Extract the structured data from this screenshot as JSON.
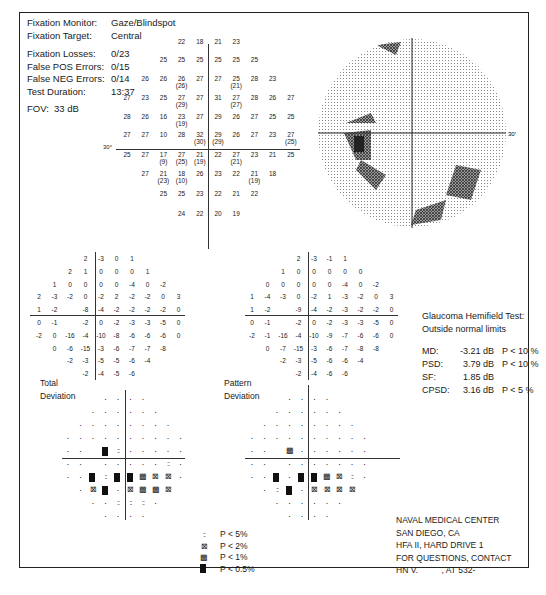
{
  "header": {
    "fixation_monitor": {
      "label": "Fixation Monitor:",
      "value": "Gaze/Blindspot"
    },
    "fixation_target": {
      "label": "Fixation Target:",
      "value": "Central"
    },
    "fixation_losses": {
      "label": "Fixation Losses:",
      "value": "0/23"
    },
    "false_pos": {
      "label": "False POS Errors:",
      "value": "0/15"
    },
    "false_neg": {
      "label": "False NEG Errors:",
      "value": "0/14"
    },
    "test_duration": {
      "label": "Test Duration:",
      "value": "13:37"
    },
    "fov": {
      "label": "FOV:",
      "value": "33 dB"
    }
  },
  "threshold_plot": {
    "axis_label_left": "30°",
    "axis_label_right": "30°",
    "rows": [
      [
        "",
        "",
        "",
        "22",
        "18",
        "21",
        "23",
        "",
        "",
        ""
      ],
      [
        "",
        "",
        "25",
        "25",
        "25",
        "25",
        "25",
        "25",
        "",
        ""
      ],
      [
        "",
        "26",
        "26",
        "26 (26)",
        "27",
        "27",
        "25 (21)",
        "28",
        "23",
        ""
      ],
      [
        "27",
        "23",
        "25",
        "27 (29)",
        "27",
        "31",
        "27 (27)",
        "28",
        "26",
        "27"
      ],
      [
        "28",
        "26",
        "16",
        "23 (19)",
        "27",
        "29",
        "26",
        "27",
        "25",
        "25"
      ],
      [
        "27",
        "27",
        "10",
        "28",
        "32 (30)",
        "29 (29)",
        "26",
        "27",
        "23",
        "27 (25)"
      ],
      [
        "25",
        "27",
        "17 (9)",
        "27 (25)",
        "21 (19)",
        "22",
        "27 (21)",
        "23",
        "21",
        "25"
      ],
      [
        "",
        "27",
        "21 (23)",
        "18 (10)",
        "26",
        "23",
        "22",
        "21 (19)",
        "18",
        ""
      ],
      [
        "",
        "",
        "25",
        "25",
        "23",
        "22",
        "21",
        "22",
        "",
        ""
      ],
      [
        "",
        "",
        "",
        "24",
        "22",
        "20",
        "19",
        "",
        "",
        ""
      ]
    ]
  },
  "total_deviation": {
    "label_line1": "Total",
    "label_line2": "Deviation",
    "rows": [
      [
        "",
        "",
        "",
        "2",
        "-3",
        "0",
        "1",
        "",
        "",
        ""
      ],
      [
        "",
        "",
        "2",
        "1",
        "0",
        "0",
        "0",
        "1",
        "",
        ""
      ],
      [
        "",
        "1",
        "0",
        "0",
        "0",
        "0",
        "-4",
        "0",
        "-2",
        ""
      ],
      [
        "2",
        "-3",
        "-2",
        "0",
        "-2",
        "2",
        "-2",
        "-2",
        "0",
        "3"
      ],
      [
        "1",
        "-2",
        "",
        "-8",
        "-4",
        "-2",
        "-2",
        "-2",
        "-2",
        "0"
      ],
      [
        "0",
        "-1",
        "",
        "-2",
        "0",
        "-2",
        "-3",
        "-3",
        "-5",
        "0"
      ],
      [
        "-2",
        "0",
        "-16",
        "-4",
        "-10",
        "-8",
        "-6",
        "-6",
        "-6",
        "0"
      ],
      [
        "",
        "0",
        "-6",
        "-15",
        "-3",
        "-6",
        "-7",
        "-7",
        "-8",
        ""
      ],
      [
        "",
        "",
        "-2",
        "-3",
        "-5",
        "-5",
        "-6",
        "-4",
        "",
        ""
      ],
      [
        "",
        "",
        "",
        "-2",
        "-4",
        "-5",
        "-6",
        "",
        "",
        ""
      ]
    ],
    "prob_rows": [
      [
        "",
        "",
        "",
        "dot",
        "dot",
        "dot",
        "dot",
        "",
        "",
        ""
      ],
      [
        "",
        "",
        "dot",
        "dot",
        "dot",
        "dot",
        "dot",
        "dot",
        "",
        ""
      ],
      [
        "",
        "dot",
        "dot",
        "dot",
        "dot",
        "dot",
        "dot",
        "dot",
        "dot",
        ""
      ],
      [
        "dot",
        "dot",
        "dot",
        "dot",
        "dot",
        "dot",
        "dot",
        "dot",
        "dot",
        "dot"
      ],
      [
        "dot",
        "dot",
        "",
        "p05",
        "p5",
        "dot",
        "dot",
        "dot",
        "dot",
        "dot"
      ],
      [
        "dot",
        "dot",
        "",
        "dot",
        "dot",
        "dot",
        "dot",
        "dot",
        "p5",
        "dot"
      ],
      [
        "dot",
        "dot",
        "p05",
        "p5",
        "p05",
        "p05",
        "p1",
        "p2",
        "p2",
        "dot"
      ],
      [
        "",
        "dot",
        "p2",
        "p05",
        "dot",
        "p2",
        "p1",
        "p1",
        "p2",
        ""
      ],
      [
        "",
        "",
        "dot",
        "dot",
        "p5",
        "p5",
        "p5",
        "dot",
        "",
        ""
      ],
      [
        "",
        "",
        "",
        "dot",
        "dot",
        "dot",
        "dot",
        "",
        "",
        ""
      ]
    ]
  },
  "pattern_deviation": {
    "label_line1": "Pattern",
    "label_line2": "Deviation",
    "rows": [
      [
        "",
        "",
        "",
        "2",
        "-3",
        "-1",
        "1",
        "",
        "",
        ""
      ],
      [
        "",
        "",
        "1",
        "0",
        "0",
        "0",
        "0",
        "0",
        "",
        ""
      ],
      [
        "",
        "0",
        "0",
        "0",
        "0",
        "0",
        "-4",
        "0",
        "-2",
        ""
      ],
      [
        "1",
        "-4",
        "-3",
        "0",
        "-2",
        "1",
        "-3",
        "-2",
        "0",
        "3"
      ],
      [
        "1",
        "-2",
        "",
        "-9",
        "-4",
        "-2",
        "-3",
        "-2",
        "-2",
        "0"
      ],
      [
        "0",
        "-1",
        "",
        "-2",
        "0",
        "-2",
        "-3",
        "-3",
        "-5",
        "0"
      ],
      [
        "-2",
        "-1",
        "-16",
        "-4",
        "-10",
        "-9",
        "-7",
        "-6",
        "-6",
        "0"
      ],
      [
        "",
        "0",
        "-7",
        "-15",
        "-3",
        "-6",
        "-7",
        "-8",
        "-8",
        ""
      ],
      [
        "",
        "",
        "-2",
        "-3",
        "-5",
        "-6",
        "-6",
        "-4",
        "",
        ""
      ],
      [
        "",
        "",
        "",
        "-2",
        "-4",
        "-6",
        "-6",
        "",
        "",
        ""
      ]
    ],
    "prob_rows": [
      [
        "",
        "",
        "",
        "dot",
        "dot",
        "dot",
        "dot",
        "",
        "",
        ""
      ],
      [
        "",
        "",
        "dot",
        "dot",
        "dot",
        "dot",
        "dot",
        "dot",
        "",
        ""
      ],
      [
        "",
        "dot",
        "dot",
        "dot",
        "dot",
        "dot",
        "dot",
        "dot",
        "dot",
        ""
      ],
      [
        "dot",
        "dot",
        "dot",
        "dot",
        "dot",
        "dot",
        "dot",
        "dot",
        "dot",
        "dot"
      ],
      [
        "dot",
        "dot",
        "",
        "p1",
        "dot",
        "dot",
        "dot",
        "dot",
        "dot",
        "dot"
      ],
      [
        "dot",
        "dot",
        "",
        "dot",
        "dot",
        "dot",
        "dot",
        "dot",
        "dot",
        "dot"
      ],
      [
        "dot",
        "dot",
        "p05",
        "dot",
        "p05",
        "p05",
        "p1",
        "p2",
        "p5",
        "dot"
      ],
      [
        "",
        "dot",
        "p5",
        "p05",
        "dot",
        "p2",
        "p2",
        "p2",
        "p2",
        ""
      ],
      [
        "",
        "",
        "dot",
        "dot",
        "dot",
        "dot",
        "dot",
        "dot",
        "",
        ""
      ],
      [
        "",
        "",
        "",
        "dot",
        "dot",
        "dot",
        "dot",
        "",
        "",
        ""
      ]
    ]
  },
  "stats": {
    "ght_label": "Glaucoma Hemifield Test:",
    "ght_value": "Outside normal limits",
    "md": {
      "label": "MD:",
      "value": "-3.21 dB",
      "p": "P < 10 %"
    },
    "psd": {
      "label": "PSD:",
      "value": "3.79 dB",
      "p": "P < 10 %"
    },
    "sf": {
      "label": "SF:",
      "value": "1.85 dB",
      "p": ""
    },
    "cpsd": {
      "label": "CPSD:",
      "value": "3.16 dB",
      "p": "P < 5 %"
    }
  },
  "legend": [
    {
      "symbol": "p5",
      "label": "P < 5%"
    },
    {
      "symbol": "p2",
      "label": "P < 2%"
    },
    {
      "symbol": "p1",
      "label": "P < 1%"
    },
    {
      "symbol": "p05",
      "label": "P < 0.5%"
    }
  ],
  "footer": {
    "line1": "NAVAL MEDICAL CENTER",
    "line2": "SAN DIEGO, CA",
    "line3": "HFA II, HARD DRIVE 1",
    "line4": "FOR QUESTIONS, CONTACT",
    "line5": "HN V.          , AT 532-"
  },
  "colors": {
    "ink": "#1a1a1a",
    "grayscale_light": "#b0b0b0",
    "grayscale_dark": "#404040"
  }
}
